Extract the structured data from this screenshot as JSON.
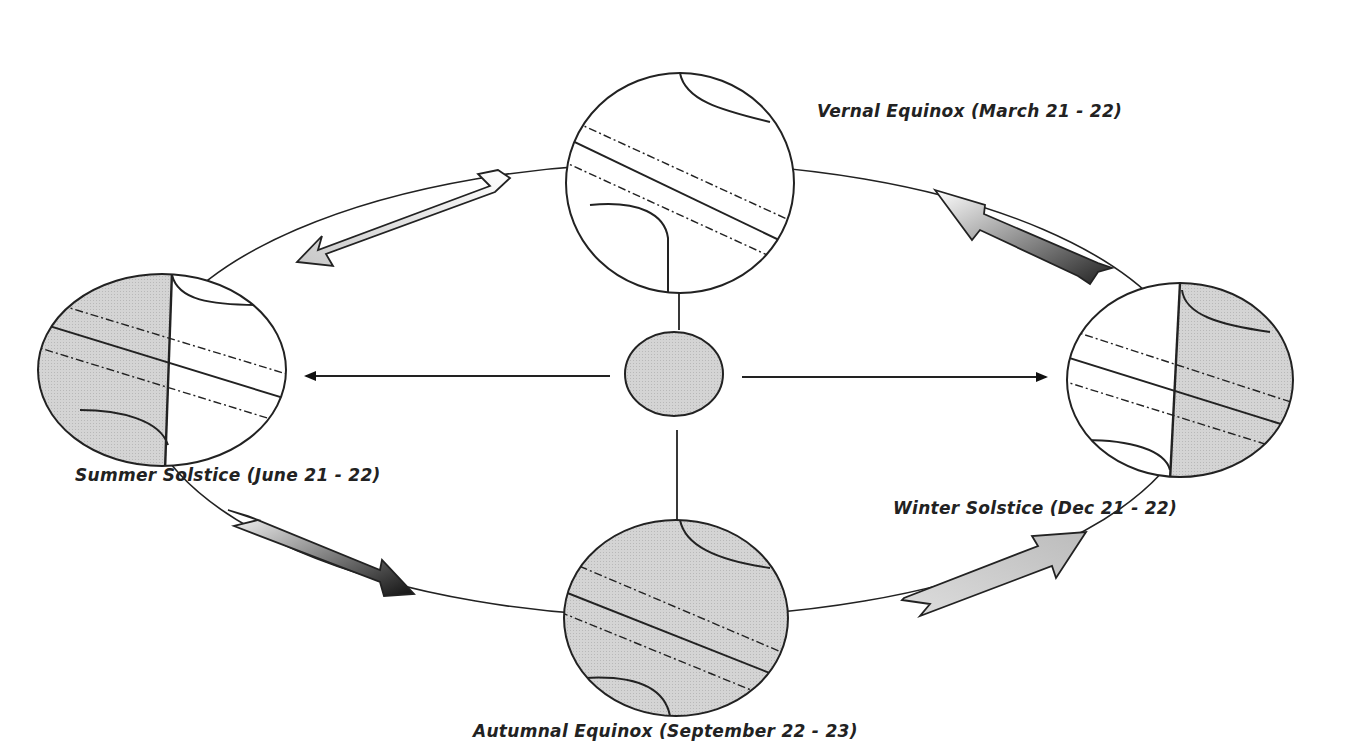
{
  "diagram": {
    "sun": {
      "name": "Sun",
      "fill": "#bdbdbd"
    },
    "positions": [
      {
        "id": "vernal",
        "label": "Vernal Equinox (March 21 - 22)",
        "lit_side": "none-shaded"
      },
      {
        "id": "summer",
        "label": "Summer Solstice (June 21 - 22)",
        "lit_side": "left-half-shaded"
      },
      {
        "id": "winter",
        "label": "Winter Solstice (Dec 21 - 22)",
        "lit_side": "right-half-shaded"
      },
      {
        "id": "autumnal",
        "label": "Autumnal Equinox (September 22 - 23)",
        "lit_side": "fully-shaded"
      }
    ],
    "orbit_direction": "counter-clockwise (as drawn: top → left → bottom → right → top)",
    "colors": {
      "stroke": "#222222",
      "shade": "#cfcfcf",
      "background": "#ffffff"
    }
  }
}
